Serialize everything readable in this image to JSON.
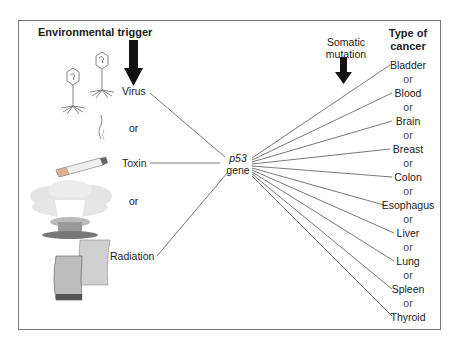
{
  "headers": {
    "left": "Environmental trigger",
    "middle_line1": "Somatic",
    "middle_line2": "mutation",
    "right_line1": "Type of",
    "right_line2": "cancer"
  },
  "triggers": [
    {
      "label": "Virus",
      "icon": "bacteriophage-icon"
    },
    {
      "label": "Toxin",
      "icon": "cigarette-icon"
    },
    {
      "label": "Radiation",
      "icon": "nuclear-plant-icon"
    }
  ],
  "connector_word": "or",
  "gene": {
    "name": "p53",
    "suffix": "gene"
  },
  "cancers": [
    "Bladder",
    "Blood",
    "Brain",
    "Breast",
    "Colon",
    "Esophagus",
    "Liver",
    "Lung",
    "Spleen",
    "Thyroid"
  ]
}
